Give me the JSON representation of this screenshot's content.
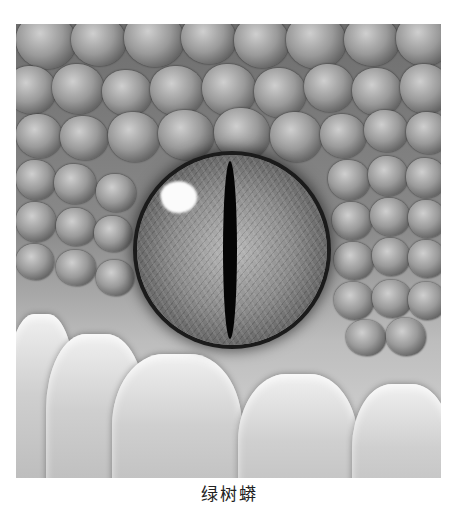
{
  "image": {
    "subject": "close-up of reptile eye with vertical slit pupil surrounded by scales",
    "tone": "grayscale",
    "highlight_color": "#fbfbfb",
    "pupil_color": "#050505"
  },
  "caption": {
    "text": "绿树蟒",
    "truncated": true
  }
}
